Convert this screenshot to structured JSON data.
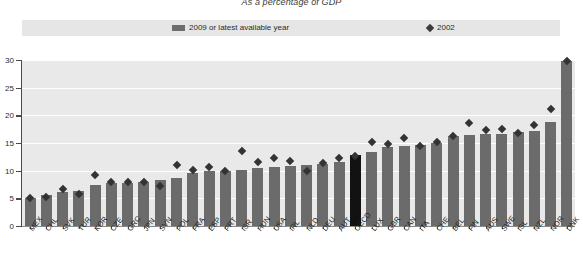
{
  "subtitle": "As a percentage of GDP",
  "legend": {
    "items": [
      {
        "label": "2009 or latest available year",
        "marker": "bar-swatch-icon",
        "color": "#6b6b6b"
      },
      {
        "label": "2002",
        "marker": "diamond-marker-icon",
        "color": "#333333"
      }
    ]
  },
  "axis": {
    "y_ticks": [
      "0",
      "5",
      "10",
      "15",
      "20",
      "25",
      "30"
    ],
    "y_min": 0,
    "y_max": 30
  },
  "colors": {
    "bar": "#6b6b6b",
    "bar_highlight": "#121212",
    "marker": "#333333",
    "plot_background": "#e9e9e9",
    "legend_background": "#e6e6e6",
    "gridline": "#ffffff"
  },
  "chart_data": {
    "type": "bar",
    "title": "As a percentage of GDP",
    "xlabel": "",
    "ylabel": "",
    "ylim": [
      0,
      30
    ],
    "grid": true,
    "legend_position": "top",
    "highlight_category": "OECD",
    "categories": [
      "MEX",
      "CHL",
      "SVK",
      "TUR",
      "KOR",
      "CZE",
      "GRC",
      "JPN",
      "SVN",
      "POL",
      "FRA",
      "ESP",
      "PRT",
      "ISR",
      "HUN",
      "USA",
      "IRL",
      "NLD",
      "DEU",
      "AUT",
      "OECD",
      "LUX",
      "GBR",
      "CAN",
      "ITA",
      "CHE",
      "BEL",
      "FIN",
      "AUS",
      "SWE",
      "ISL",
      "NZL",
      "NOR",
      "DNK"
    ],
    "series": [
      {
        "name": "2009 or latest available year",
        "type": "bar",
        "values": [
          5.1,
          5.6,
          6.1,
          6.4,
          7.4,
          7.8,
          7.8,
          7.9,
          8.3,
          8.6,
          9.5,
          9.9,
          10.0,
          10.2,
          10.4,
          10.6,
          10.9,
          11.1,
          11.2,
          11.5,
          12.9,
          13.3,
          14.2,
          14.5,
          14.7,
          15.0,
          16.3,
          16.4,
          16.6,
          16.7,
          17.0,
          17.2,
          18.8,
          29.8
        ]
      },
      {
        "name": "2002",
        "type": "scatter",
        "marker": "diamond",
        "values": [
          5.0,
          5.3,
          6.6,
          5.8,
          9.2,
          8.0,
          7.9,
          8.0,
          7.2,
          11.0,
          10.2,
          10.6,
          10.0,
          13.5,
          11.5,
          12.2,
          11.8,
          9.9,
          11.4,
          12.2,
          12.6,
          15.2,
          14.9,
          15.9,
          14.5,
          15.2,
          16.3,
          18.6,
          17.3,
          17.6,
          16.8,
          18.3,
          21.1,
          29.9
        ]
      }
    ]
  }
}
